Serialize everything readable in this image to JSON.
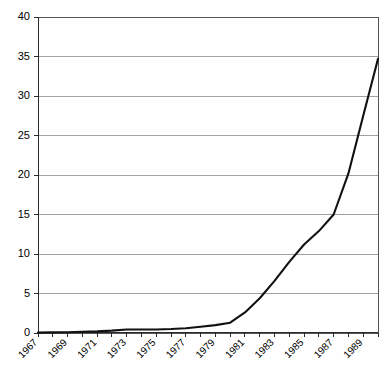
{
  "chart_data": {
    "type": "line",
    "title": "",
    "subtitle": "",
    "xlabel": "",
    "ylabel": "",
    "grid": true,
    "legend": false,
    "legend_position": "none",
    "xlim": [
      1967,
      1990
    ],
    "ylim": [
      0,
      40
    ],
    "y_ticks": [
      0,
      5,
      10,
      15,
      20,
      25,
      30,
      35,
      40
    ],
    "y_tick_labels": [
      "0",
      "5",
      "10",
      "15",
      "20",
      "25",
      "30",
      "35",
      "40"
    ],
    "x_ticks": [
      1967,
      1968,
      1969,
      1970,
      1971,
      1972,
      1973,
      1974,
      1975,
      1976,
      1977,
      1978,
      1979,
      1980,
      1981,
      1982,
      1983,
      1984,
      1985,
      1986,
      1987,
      1988,
      1989,
      1990
    ],
    "x_tick_labels": [
      "1967",
      "",
      "1969",
      "",
      "1971",
      "",
      "1973",
      "",
      "1975",
      "",
      "1977",
      "",
      "1979",
      "",
      "1981",
      "",
      "1983",
      "",
      "1985",
      "",
      "1987",
      "",
      "1989",
      ""
    ],
    "x_labeled_years": [
      "1967",
      "1969",
      "1971",
      "1973",
      "1975",
      "1977",
      "1979",
      "1981",
      "1983",
      "1985",
      "1987",
      "1989"
    ],
    "x_label_rotation_deg": 45,
    "line_color": "#111111",
    "grid_color": "#8a8a8a",
    "axis_color": "#2b2b2b",
    "background_color": "#ffffff",
    "series": [
      {
        "name": "series-1",
        "x": [
          1967,
          1968,
          1969,
          1970,
          1971,
          1972,
          1973,
          1974,
          1975,
          1976,
          1977,
          1978,
          1979,
          1980,
          1981,
          1982,
          1983,
          1984,
          1985,
          1986,
          1987,
          1988,
          1989,
          1990
        ],
        "values": [
          0.05,
          0.08,
          0.1,
          0.15,
          0.2,
          0.3,
          0.45,
          0.45,
          0.45,
          0.5,
          0.6,
          0.8,
          1.0,
          1.3,
          2.6,
          4.4,
          6.6,
          9.0,
          11.2,
          12.9,
          15.0,
          20.2,
          27.5,
          34.7
        ]
      }
    ]
  }
}
